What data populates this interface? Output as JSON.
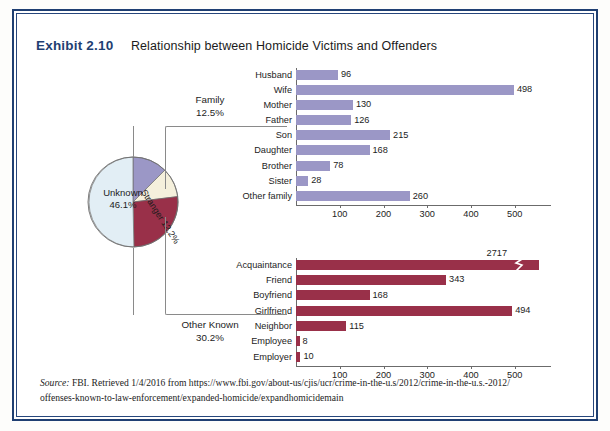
{
  "exhibit": {
    "label": "Exhibit 2.10",
    "title": "Relationship between Homicide Victims and Offenders"
  },
  "pie": {
    "slices": [
      {
        "name": "Family",
        "percent_label": "12.5%",
        "value": 12.5,
        "color": "#9b97c6"
      },
      {
        "name": "Stranger",
        "percent_label": "12.2%",
        "value": 12.2,
        "color": "#f5f0dc"
      },
      {
        "name": "Other Known",
        "percent_label": "30.2%",
        "value": 30.2,
        "color": "#993049"
      },
      {
        "name": "Unknown",
        "percent_label": "46.1%",
        "value": 46.1,
        "color": "#e2eef5"
      }
    ],
    "inline_labels": {
      "unknown_name": "Unknown",
      "unknown_percent": "46.1%",
      "stranger_name": "Stranger",
      "stranger_percent": "12.2%"
    },
    "callouts": {
      "family_name": "Family",
      "family_percent": "12.5%",
      "other_known_name": "Other Known",
      "other_known_percent": "30.2%"
    }
  },
  "chart_data": [
    {
      "type": "bar",
      "id": "family",
      "title": "Family",
      "orientation": "horizontal",
      "color": "#9b97c6",
      "categories": [
        "Husband",
        "Wife",
        "Mother",
        "Father",
        "Son",
        "Daughter",
        "Brother",
        "Sister",
        "Other family"
      ],
      "values": [
        96,
        498,
        130,
        126,
        215,
        168,
        78,
        28,
        260
      ],
      "value_labels": [
        "96",
        "498",
        "130",
        "126",
        "215",
        "168",
        "78",
        "28",
        "260"
      ],
      "xticks": [
        100,
        200,
        300,
        400,
        500
      ],
      "xtick_labels": [
        "100",
        "200",
        "300",
        "400",
        "500"
      ],
      "xlim": [
        0,
        560
      ],
      "xlabel": "",
      "ylabel": "",
      "grid": false,
      "legend": "none"
    },
    {
      "type": "bar",
      "id": "other_known",
      "title": "Other Known",
      "orientation": "horizontal",
      "color": "#993049",
      "categories": [
        "Acquaintance",
        "Friend",
        "Boyfriend",
        "Girlfriend",
        "Neighbor",
        "Employee",
        "Employer"
      ],
      "values": [
        2717,
        343,
        168,
        494,
        115,
        8,
        10
      ],
      "value_labels": [
        "2717",
        "343",
        "168",
        "494",
        "115",
        "8",
        "10"
      ],
      "axis_break": {
        "category": "Acquaintance",
        "note": "bar truncated with zigzag break marker"
      },
      "xticks": [
        100,
        200,
        300,
        400,
        500
      ],
      "xtick_labels": [
        "100",
        "200",
        "300",
        "400",
        "500"
      ],
      "xlim": [
        0,
        560
      ],
      "xlabel": "",
      "ylabel": "",
      "grid": false,
      "legend": "none"
    }
  ],
  "source": {
    "prefix": "Source:",
    "line1": " FBI. Retrieved 1/4/2016 from https://www.fbi.gov/about-us/cjis/ucr/crime-in-the-u.s/2012/crime-in-the-u.s.-2012/",
    "line2": "offenses-known-to-law-enforcement/expanded-homicide/expandhomicidemain"
  },
  "colors": {
    "frame_blue": "#1f3f72",
    "bar_purple": "#9b97c6",
    "bar_maroon": "#993049",
    "pie_unknown": "#e2eef5",
    "pie_stranger": "#f5f0dc"
  }
}
